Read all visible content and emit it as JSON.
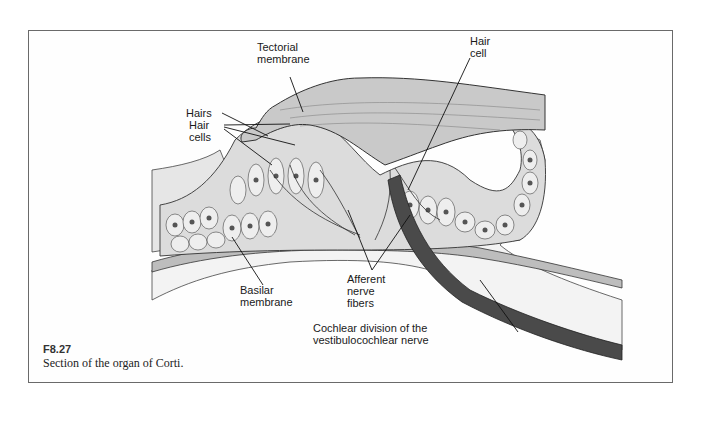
{
  "figure": {
    "number": "F8.27",
    "caption": "Section of the organ of Corti."
  },
  "labels": {
    "tectorial_membrane": [
      "Tectorial",
      "membrane"
    ],
    "hair_cell": [
      "Hair",
      "cell"
    ],
    "hairs": "Hairs",
    "hair_cells": [
      "Hair",
      "cells"
    ],
    "basilar_membrane": [
      "Basilar",
      "membrane"
    ],
    "afferent_nerve_fibers": [
      "Afferent",
      "nerve",
      "fibers"
    ],
    "cochlear_division": [
      "Cochlear division of the",
      "vestibulocochlear nerve"
    ]
  },
  "colors": {
    "frame_border": "#6a6a6a",
    "tissue_fill": "#d9d9d9",
    "membrane_fill": "#c8c8c8",
    "nerve_fill": "#4a4a4a",
    "line": "#222222"
  }
}
